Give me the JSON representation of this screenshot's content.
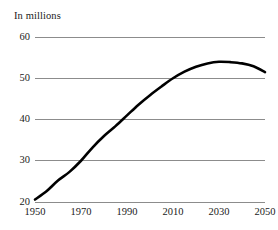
{
  "chart_data": {
    "type": "line",
    "title": "In millions",
    "xlabel": "",
    "ylabel": "",
    "ylim": [
      20,
      60
    ],
    "xlim": [
      1950,
      2050
    ],
    "grid": true,
    "legend": false,
    "legend_position": "none",
    "y_ticks": [
      20,
      30,
      40,
      50,
      60
    ],
    "y_tick_labels": [
      "20",
      "30",
      "40",
      "50",
      "60"
    ],
    "x_ticks": [
      1950,
      1970,
      1990,
      2010,
      2030,
      2050
    ],
    "x_tick_labels": [
      "1950",
      "1970",
      "1990",
      "2010",
      "2030",
      "2050"
    ],
    "line_color": "#000000",
    "grid_color": "#8c8c8c",
    "series": [
      {
        "name": "population",
        "x": [
          1950,
          1955,
          1960,
          1965,
          1970,
          1975,
          1980,
          1985,
          1990,
          1995,
          2000,
          2005,
          2010,
          2015,
          2020,
          2025,
          2030,
          2035,
          2040,
          2045,
          2050
        ],
        "values": [
          20.6,
          22.6,
          25.2,
          27.3,
          30.0,
          33.2,
          36.0,
          38.4,
          41.0,
          43.6,
          45.9,
          48.0,
          50.0,
          51.6,
          52.8,
          53.6,
          54.0,
          53.9,
          53.6,
          52.9,
          51.5
        ]
      }
    ]
  }
}
